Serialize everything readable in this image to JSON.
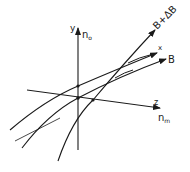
{
  "diagram": {
    "axes": {
      "y": {
        "label": "y",
        "sublabel": "n",
        "sublabel_sub": "o"
      },
      "z": {
        "label": "z",
        "sublabel": "n",
        "sublabel_sub": "m"
      }
    },
    "curves": [
      {
        "id": "x",
        "label": "x"
      },
      {
        "id": "B",
        "label": "B"
      },
      {
        "id": "B-plus-delta-B",
        "label": "B+ΔB"
      }
    ],
    "colors": {
      "stroke": "#1a1a1a",
      "background": "#ffffff"
    }
  }
}
